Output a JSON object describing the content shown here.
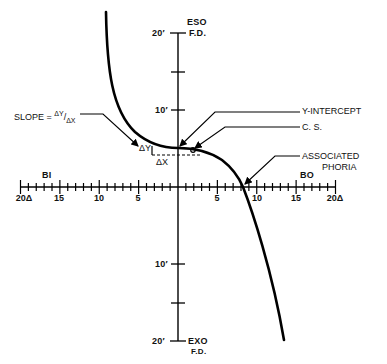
{
  "diagram": {
    "axes": {
      "vertical": {
        "top_label": "ESO",
        "top_sublabel": "F.D.",
        "bottom_label": "EXO",
        "bottom_sublabel": "F.D.",
        "ticks": [
          {
            "value": 20,
            "label": "20′",
            "side": "eso"
          },
          {
            "value": 10,
            "label": "10′",
            "side": "eso"
          },
          {
            "value": 10,
            "label": "10′",
            "side": "exo"
          },
          {
            "value": 20,
            "label": "20′",
            "side": "exo"
          }
        ],
        "unit": "minutes of arc"
      },
      "horizontal": {
        "left_label": "BI",
        "right_label": "BO",
        "ticks_left": [
          "20Δ",
          "15",
          "10",
          "5"
        ],
        "ticks_right": [
          "5",
          "10",
          "15",
          "20Δ"
        ],
        "unit": "prism diopters"
      }
    },
    "annotations": {
      "slope": "SLOPE = ΔY/ΔX",
      "slope_prefix": "SLOPE = ",
      "slope_num": "ΔY",
      "slope_den": "ΔX",
      "delta_y": "ΔY",
      "delta_x": "ΔX",
      "y_intercept": "Y-INTERCEPT",
      "center_of_symmetry": "C. S.",
      "associated_phoria_line1": "ASSOCIATED",
      "associated_phoria_line2": "PHORIA"
    },
    "curve": {
      "description": "Forced-vergence fixation disparity curve, descending from upper-left (BI, eso) to lower-right (BO, exo)",
      "points_prism_vs_minutes": [
        [
          -9.2,
          22.5
        ],
        [
          -8.5,
          15
        ],
        [
          -7.5,
          10
        ],
        [
          -6,
          7
        ],
        [
          -4,
          5.5
        ],
        [
          -2,
          4.8
        ],
        [
          0,
          5
        ],
        [
          2,
          4.5
        ],
        [
          4,
          3
        ],
        [
          6,
          1.5
        ],
        [
          8.3,
          0
        ],
        [
          10,
          -6
        ],
        [
          11.5,
          -12
        ],
        [
          13.5,
          -20
        ]
      ],
      "y_intercept_minutes": 5,
      "associated_phoria_prism": 8.3,
      "stroke_color": "#000000"
    }
  }
}
